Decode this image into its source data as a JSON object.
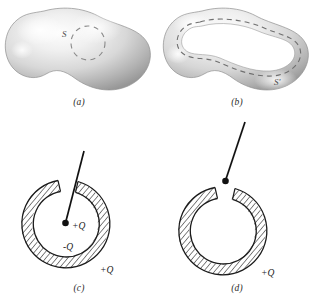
{
  "figure": {
    "kind": "physics-textbook-figure",
    "background_color": "#ffffff",
    "panels": [
      {
        "id": "a",
        "caption": "(a)",
        "description": "Solid shaded conductor blob with a dashed spherical Gaussian surface drawn inside it",
        "surface_label": "S",
        "blob_fill_light": "#f4f4f4",
        "blob_fill_dark": "#9c9c9c",
        "dash_color": "#8a8a8a"
      },
      {
        "id": "b",
        "caption": "(b)",
        "description": "Hollow shaded conductor blob containing a large internal cavity, with a dashed Gaussian surface following the cavity wall",
        "surface_label": "S'",
        "blob_fill_light": "#f4f4f4",
        "blob_fill_dark": "#9c9c9c",
        "dash_color": "#6f6f6f"
      },
      {
        "id": "c",
        "caption": "(c)",
        "description": "Hatched conducting shell in cross-section with a point charge on a thin rod at the center; induced charges labelled on inner and outer surfaces",
        "hatch_color": "#2a2a2a",
        "charge_labels": [
          {
            "text": "+Q",
            "meaning": "point charge at center of cavity"
          },
          {
            "text": "-Q",
            "meaning": "induced charge on inner surface of shell"
          },
          {
            "text": "+Q",
            "meaning": "induced charge on outer surface of shell"
          }
        ]
      },
      {
        "id": "d",
        "caption": "(d)",
        "description": "Hatched conducting shell in cross-section with the point charge on the rod withdrawn above the shell opening; only the outer surface charge remains",
        "hatch_color": "#2a2a2a",
        "charge_labels": [
          {
            "text": "+Q",
            "meaning": "charge on outer surface of shell"
          }
        ]
      }
    ]
  }
}
